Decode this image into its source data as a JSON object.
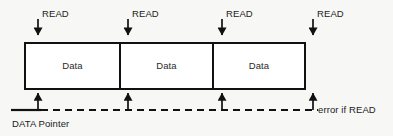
{
  "figure": {
    "background_color": "#f7f7f5",
    "ink_color": "#111111"
  },
  "read_markers": [
    {
      "label": "READ",
      "arrow": "down-arrow-icon",
      "x": 38,
      "label_x": 42,
      "label_y": 8
    },
    {
      "label": "READ",
      "arrow": "down-arrow-icon",
      "x": 128,
      "label_x": 132,
      "label_y": 8
    },
    {
      "label": "READ",
      "arrow": "down-arrow-icon",
      "x": 222,
      "label_x": 226,
      "label_y": 8
    },
    {
      "label": "READ",
      "arrow": "down-arrow-icon",
      "x": 313,
      "label_x": 317,
      "label_y": 8
    }
  ],
  "data_cells": [
    {
      "label": "Data",
      "x": 25,
      "width": 95
    },
    {
      "label": "Data",
      "x": 120,
      "width": 93
    },
    {
      "label": "Data",
      "x": 213,
      "width": 92
    }
  ],
  "pointer_markers": [
    {
      "arrow": "up-arrow-icon",
      "x": 38
    },
    {
      "arrow": "up-arrow-icon",
      "x": 128
    },
    {
      "arrow": "up-arrow-icon",
      "x": 222
    },
    {
      "arrow": "up-arrow-icon",
      "x": 313
    }
  ],
  "annotations": {
    "error_note": "error if READ",
    "error_note_x": 318,
    "error_note_y": 104,
    "pointer_caption": "DATA Pointer",
    "pointer_caption_x": 12,
    "pointer_caption_y": 118
  },
  "pointer_line": {
    "solid_start_x": 11,
    "solid_end_x": 40,
    "dashed_end_x": 318,
    "y": 110,
    "style": "dashed"
  },
  "box_geometry": {
    "top_y": 43,
    "bottom_y": 89,
    "left_x": 25,
    "right_x": 305
  }
}
